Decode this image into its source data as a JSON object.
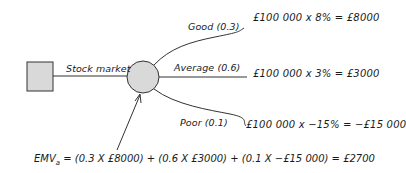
{
  "diagram": {
    "type": "decision-tree",
    "decision_node": {
      "shape": "square",
      "fill": "#d9d9d9"
    },
    "decision_branch": {
      "label": "Stock market"
    },
    "chance_node": {
      "shape": "circle",
      "fill": "#d9d9d9"
    },
    "outcomes": [
      {
        "label": "Good (0.3)",
        "calculation": "£100 000 x 8% = £8000"
      },
      {
        "label": "Average (0.6)",
        "calculation": "£100 000 x 3% = £3000"
      },
      {
        "label": "Poor (0.1)",
        "calculation": "£100 000 x −15% = −£15 000"
      }
    ],
    "emv": {
      "prefix": "EMV",
      "subscript": "a",
      "formula": " = (0.3 X £8000) + (0.6 X £3000) + (0.1 X −£15 000) = £2700"
    },
    "colors": {
      "line": "#333333",
      "node_fill": "#d9d9d9"
    }
  }
}
